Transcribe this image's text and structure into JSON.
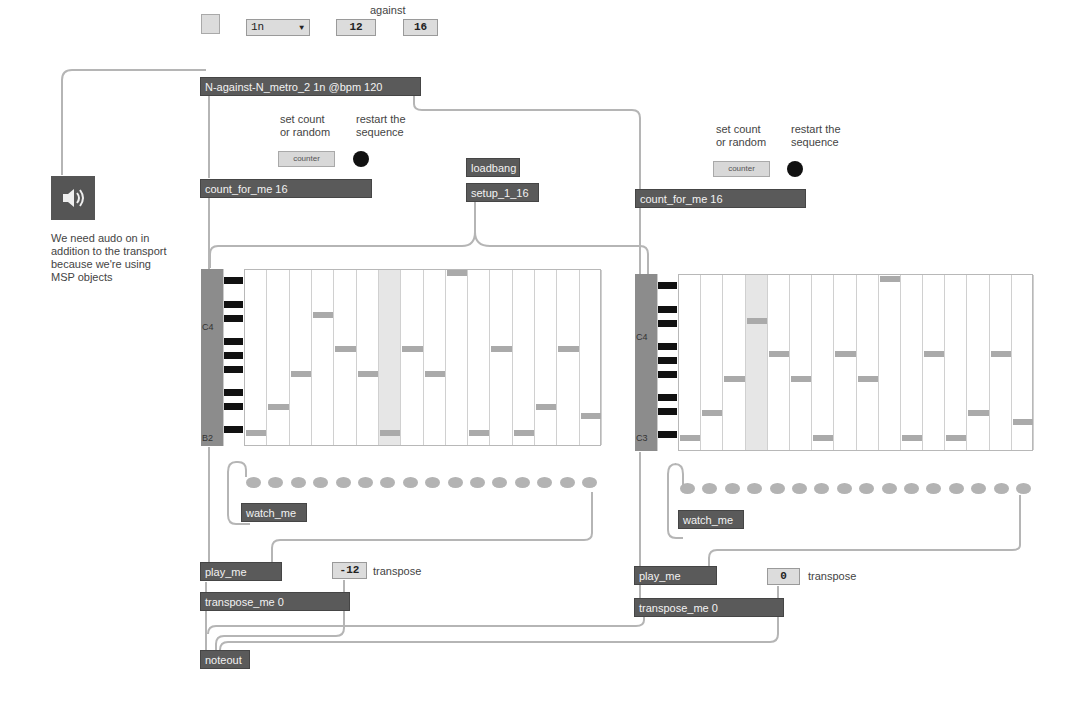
{
  "header": {
    "against_label": "against",
    "toggle": {
      "state": "off"
    },
    "note_value_menu": {
      "selected": "1n",
      "arrow": "▼"
    },
    "count_a": "12",
    "count_b": "16",
    "metro_object": "N-against-N_metro_2 1n @bpm 120"
  },
  "audio": {
    "icon": "speaker-icon",
    "comment": [
      "We need audo on in",
      "addition to the transport",
      "because we're using",
      "MSP objects"
    ]
  },
  "setup": {
    "loadbang": "loadbang",
    "setup_object": "setup_1_16"
  },
  "voices": [
    {
      "set_count_comment": [
        "set count",
        "or random"
      ],
      "restart_comment": [
        "restart the",
        "sequence"
      ],
      "counter_button": "counter",
      "count_object": "count_for_me 16",
      "pitch_label_top": "C4",
      "pitch_label_bottom": "B2",
      "highlight_column": 6,
      "notes_y": [
        432,
        406,
        373,
        314,
        348,
        373,
        432,
        348,
        373,
        272,
        432,
        348,
        432,
        406,
        348,
        415
      ],
      "step_dots": 16,
      "watch_object": "watch_me",
      "play_object": "play_me",
      "transpose_value": "-12",
      "transpose_comment": "transpose",
      "transpose_object": "transpose_me 0"
    },
    {
      "set_count_comment": [
        "set count",
        "or random"
      ],
      "restart_comment": [
        "restart the",
        "sequence"
      ],
      "counter_button": "counter",
      "count_object": "count_for_me 16",
      "pitch_label_top": "C4",
      "pitch_label_bottom": "C3",
      "highlight_column": 3,
      "notes_y": [
        437,
        412,
        378,
        320,
        353,
        378,
        437,
        353,
        378,
        278,
        437,
        353,
        437,
        412,
        353,
        421
      ],
      "step_dots": 16,
      "watch_object": "watch_me",
      "play_object": "play_me",
      "transpose_value": "0",
      "transpose_comment": "transpose",
      "transpose_object": "transpose_me 0"
    }
  ],
  "output": {
    "noteout": "noteout"
  },
  "colors": {
    "object_bg": "#5a5a5a",
    "number_bg": "#dcdcdc",
    "patch_cord": "#b0b0b0",
    "note_bar": "#aaaaaa",
    "bang": "#111111"
  }
}
